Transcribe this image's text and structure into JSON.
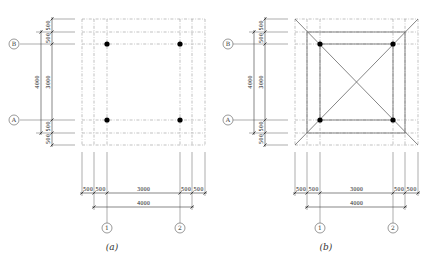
{
  "figures": [
    {
      "id": "a",
      "caption": "(a)",
      "axes_rows": [
        {
          "label": "B"
        },
        {
          "label": "A"
        }
      ],
      "axes_cols": [
        {
          "label": "1"
        },
        {
          "label": "2"
        }
      ],
      "vertical_dims": {
        "total": "4000",
        "parts": [
          "500",
          "500",
          "3000",
          "500",
          "500"
        ]
      },
      "horizontal_dims": {
        "total": "4000",
        "parts": [
          "500",
          "500",
          "3000",
          "500",
          "500"
        ]
      },
      "columns": 4,
      "has_diagonals": false
    },
    {
      "id": "b",
      "caption": "(b)",
      "axes_rows": [
        {
          "label": "B"
        },
        {
          "label": "A"
        }
      ],
      "axes_cols": [
        {
          "label": "1"
        },
        {
          "label": "2"
        }
      ],
      "vertical_dims": {
        "total": "4000",
        "parts": [
          "500",
          "500",
          "3000",
          "500",
          "500"
        ]
      },
      "horizontal_dims": {
        "total": "4000",
        "parts": [
          "500",
          "500",
          "3000",
          "500",
          "500"
        ]
      },
      "columns": 4,
      "has_diagonals": true
    }
  ]
}
